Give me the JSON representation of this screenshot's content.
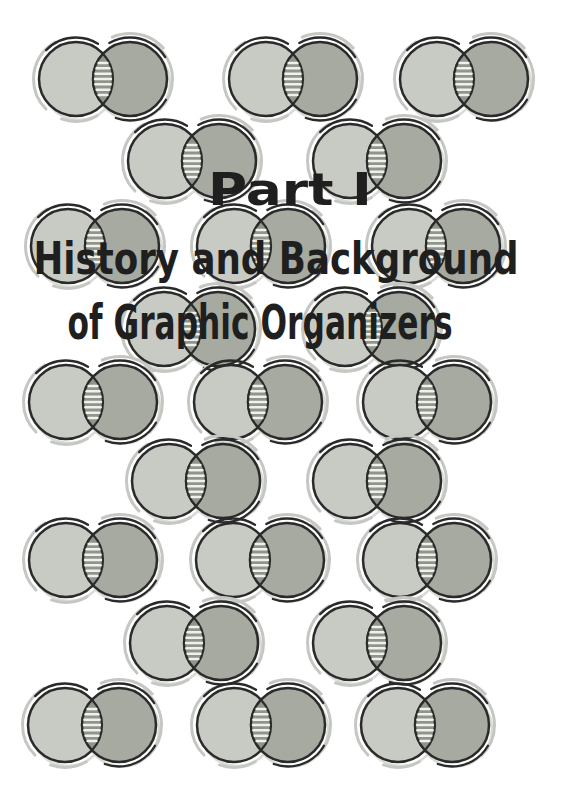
{
  "page": {
    "part_label": "Part I",
    "subtitle_line1": "History and Background",
    "subtitle_line2": "of Graphic Organizers"
  },
  "artwork": {
    "motif": "venn-diagram-two-overlapping-circles",
    "motif_count": 23,
    "hatch_lines_per_overlap": 7
  },
  "colors": {
    "background": "#ffffff",
    "text": "#1f1f1f",
    "outline": "#2a2a2a",
    "left_circle_fill": "#c8cbc4",
    "right_circle_fill": "#a6aaa0",
    "overlap_fill": "#8f958a",
    "overlap_hatch": "#f0f1ec",
    "sketch_arc_gray": "#c5c8c2",
    "shadow": "#d9dbd6"
  }
}
